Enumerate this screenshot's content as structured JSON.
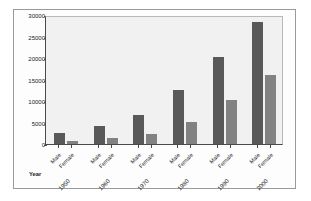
{
  "chart_data": {
    "type": "bar",
    "title": "",
    "xlabel": "Year",
    "ylabel": "Median Income",
    "categories": [
      "1950",
      "1960",
      "1970",
      "1980",
      "1990",
      "2000"
    ],
    "series": [
      {
        "name": "Male",
        "values": [
          2600,
          4200,
          6700,
          12500,
          20300,
          28400
        ],
        "color": "#595959"
      },
      {
        "name": "Female",
        "values": [
          800,
          1300,
          2400,
          5100,
          10200,
          16100
        ],
        "color": "#828282"
      }
    ],
    "ylim": [
      0,
      30000
    ],
    "yticks": [
      0,
      5000,
      10000,
      15000,
      20000,
      25000,
      30000
    ],
    "ytick_labels": [
      "0",
      "5000",
      "10000",
      "15000",
      "20000",
      "25000",
      "30000"
    ],
    "grid": false,
    "legend": "none",
    "group_tick_labels": [
      "Male",
      "Female"
    ]
  }
}
